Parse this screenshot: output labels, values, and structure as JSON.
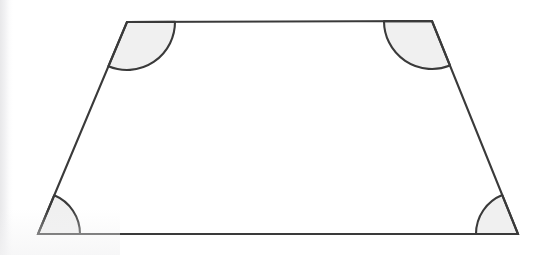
{
  "figure": {
    "kind": "geometry-diagram",
    "shape_name": "trapezoid",
    "caption": "",
    "canvas": {
      "width": 544,
      "height": 255
    },
    "style": {
      "background_color": "#ffffff",
      "stroke_color": "#3a3a3a",
      "stroke_width": 2.1,
      "angle_fill_color": "#f0f0f0",
      "angle_stroke_color": "#3a3a3a",
      "angle_stroke_width": 2.1
    },
    "vertices": [
      {
        "id": "top-left",
        "label": "",
        "x": 127,
        "y": 22
      },
      {
        "id": "top-right",
        "label": "",
        "x": 432,
        "y": 21
      },
      {
        "id": "bottom-right",
        "label": "",
        "x": 518,
        "y": 234
      },
      {
        "id": "bottom-left",
        "label": "",
        "x": 38,
        "y": 234
      }
    ],
    "edges": [
      {
        "id": "top-edge",
        "from": "top-left",
        "to": "top-right",
        "label": ""
      },
      {
        "id": "right-edge",
        "from": "top-right",
        "to": "bottom-right",
        "label": ""
      },
      {
        "id": "bottom-edge",
        "from": "bottom-right",
        "to": "bottom-left",
        "label": ""
      },
      {
        "id": "left-edge",
        "from": "bottom-left",
        "to": "top-left",
        "label": ""
      }
    ],
    "angle_marks": [
      {
        "id": "angle-top-left",
        "at": "top-left",
        "radius": 48,
        "label": "",
        "type": "obtuse"
      },
      {
        "id": "angle-top-right",
        "at": "top-right",
        "radius": 48,
        "label": "",
        "type": "obtuse"
      },
      {
        "id": "angle-bottom-right",
        "at": "bottom-right",
        "radius": 42,
        "label": "",
        "type": "acute"
      },
      {
        "id": "angle-bottom-left",
        "at": "bottom-left",
        "radius": 42,
        "label": "",
        "type": "acute"
      }
    ]
  }
}
